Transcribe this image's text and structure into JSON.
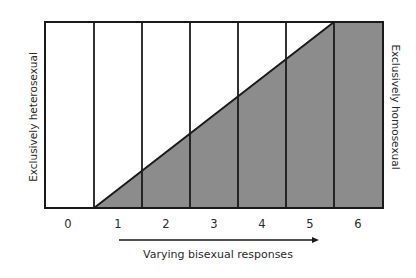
{
  "diagram": {
    "left_label": "Exclusively heterosexual",
    "right_label": "Exclusively homosexual",
    "axis_caption": "Varying bisexual responses",
    "scale_numbers": [
      "0",
      "1",
      "2",
      "3",
      "4",
      "5",
      "6"
    ],
    "colors": {
      "fill": "#8c8c8c",
      "line": "#1a1a1a",
      "background": "#ffffff"
    }
  }
}
